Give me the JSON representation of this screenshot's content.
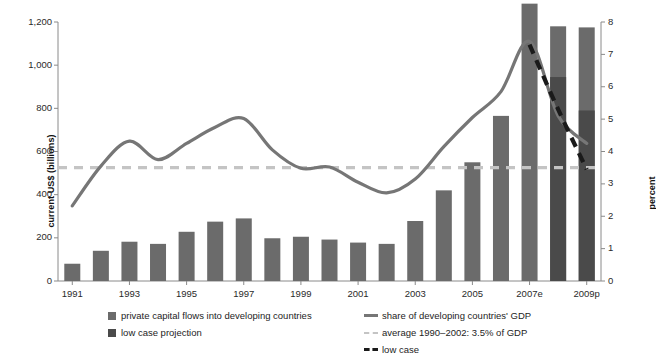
{
  "chart_data": {
    "type": "bar",
    "title": "",
    "subtitle": "",
    "xlabel": "",
    "ylabel": "current US$ (billions)",
    "ylabel_right": "percent",
    "ylim": [
      0,
      1200
    ],
    "ylim_right": [
      0,
      8
    ],
    "grid": false,
    "legend_position": "bottom",
    "categories": [
      "1991",
      "1992",
      "1993",
      "1994",
      "1995",
      "1996",
      "1997",
      "1998",
      "1999",
      "2000",
      "2001",
      "2002",
      "2003",
      "2004",
      "2005",
      "2006",
      "2007e",
      "2008e",
      "2009p"
    ],
    "xtick_labels": [
      "1991",
      "1993",
      "1995",
      "1997",
      "1999",
      "2001",
      "2003",
      "2005",
      "2007e",
      "2009p"
    ],
    "ytick_labels_left": [
      "0",
      "200",
      "400",
      "600",
      "800",
      "1,000",
      "1,200"
    ],
    "ytick_values_left": [
      0,
      200,
      400,
      600,
      800,
      1000,
      1200
    ],
    "ytick_labels_right": [
      "0",
      "1",
      "2",
      "3",
      "4",
      "5",
      "6",
      "7",
      "8"
    ],
    "ytick_values_right": [
      0,
      1,
      2,
      3,
      4,
      5,
      6,
      7,
      8
    ],
    "series": [
      {
        "name": "private capital flows into developing countries",
        "type": "bar",
        "axis": "left",
        "unit": "US$ billions",
        "color": "#6b6b6b",
        "values": [
          80,
          140,
          182,
          172,
          228,
          275,
          290,
          198,
          205,
          192,
          178,
          172,
          278,
          420,
          550,
          765,
          1285,
          1180,
          1175
        ]
      },
      {
        "name": "low case projection",
        "type": "bar",
        "axis": "left",
        "unit": "US$ billions",
        "color": "#4a4a4a",
        "values": [
          null,
          null,
          null,
          null,
          null,
          null,
          null,
          null,
          null,
          null,
          null,
          null,
          null,
          null,
          null,
          null,
          null,
          945,
          790
        ]
      },
      {
        "name": "share of developing countries' GDP",
        "type": "line",
        "axis": "right",
        "unit": "percent",
        "color": "#767676",
        "values": [
          2.32,
          3.55,
          4.32,
          3.75,
          4.25,
          4.75,
          5.02,
          4.05,
          3.48,
          3.52,
          3.05,
          2.72,
          3.15,
          4.15,
          5.05,
          5.85,
          7.4,
          5.1,
          4.25
        ]
      },
      {
        "name": "low case",
        "type": "line-dashed",
        "axis": "right",
        "unit": "percent",
        "color": "#1a1a1a",
        "values": [
          null,
          null,
          null,
          null,
          null,
          null,
          null,
          null,
          null,
          null,
          null,
          null,
          null,
          null,
          null,
          null,
          7.3,
          5.3,
          3.45
        ]
      }
    ],
    "reference_line": {
      "name": "average 1990-2002: 3.5% of GDP",
      "axis": "right",
      "value": 3.5,
      "style": "dashed",
      "color": "#c4c4c4"
    }
  },
  "legend": {
    "items": [
      {
        "label": "private capital flows into developing countries",
        "marker": "square",
        "color": "#6b6b6b"
      },
      {
        "label": "low case projection",
        "marker": "square",
        "color": "#4a4a4a"
      },
      {
        "label": "share of developing countries' GDP",
        "marker": "solid-line",
        "color": "#767676"
      },
      {
        "label": "average 1990–2002: 3.5% of GDP",
        "marker": "dashed-line",
        "color": "#c4c4c4"
      },
      {
        "label": "low case",
        "marker": "thick-dashed-line",
        "color": "#1a1a1a"
      }
    ]
  },
  "axes": {
    "left_title": "current US$ (billions)",
    "right_title": "percent"
  }
}
